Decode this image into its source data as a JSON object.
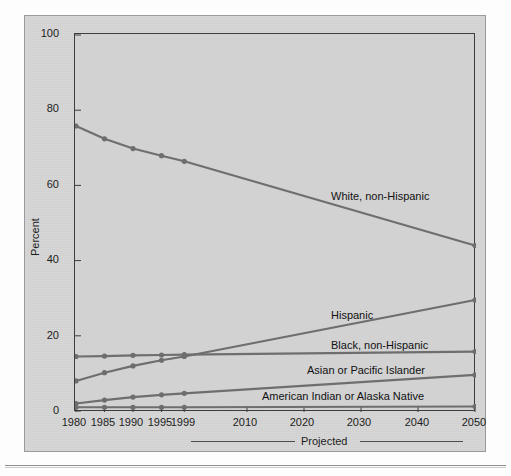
{
  "chart_data": {
    "type": "line",
    "title": "",
    "xlabel": "",
    "ylabel": "Percent",
    "ylim": [
      0,
      100
    ],
    "yticks": [
      0,
      20,
      40,
      60,
      80,
      100
    ],
    "ytick_labels": [
      "0",
      "20",
      "40",
      "60",
      "80",
      "100"
    ],
    "xticks": [
      1980,
      1985,
      1990,
      1995,
      1999,
      2010,
      2020,
      2030,
      2040,
      2050
    ],
    "xtick_labels": [
      "1980",
      "1985",
      "1990",
      "1995",
      "1999",
      "2010",
      "2020",
      "2030",
      "2040",
      "2050"
    ],
    "xlim": [
      1980,
      2050
    ],
    "grid": false,
    "legend_position": "inline-right",
    "annotations": [
      "Projected"
    ],
    "series": [
      {
        "name": "White, non-Hispanic",
        "label": "White, non-Hispanic",
        "x": [
          1980,
          1985,
          1990,
          1995,
          1999,
          2050
        ],
        "values": [
          75.8,
          72.4,
          69.8,
          67.9,
          66.4,
          44.0
        ],
        "color": "#6e6e6e"
      },
      {
        "name": "Hispanic",
        "label": "Hispanic",
        "x": [
          1980,
          1985,
          1990,
          1995,
          1999,
          2050
        ],
        "values": [
          8.0,
          10.2,
          12.0,
          13.5,
          14.5,
          29.5
        ],
        "color": "#6e6e6e"
      },
      {
        "name": "Black, non-Hispanic",
        "label": "Black, non-Hispanic",
        "x": [
          1980,
          1985,
          1990,
          1995,
          1999,
          2050
        ],
        "values": [
          14.5,
          14.6,
          14.8,
          14.9,
          15.0,
          15.8
        ],
        "color": "#6e6e6e"
      },
      {
        "name": "Asian or Pacific Islander",
        "label": "Asian or Pacific Islander",
        "x": [
          1980,
          1985,
          1990,
          1995,
          1999,
          2050
        ],
        "values": [
          2.0,
          2.9,
          3.7,
          4.3,
          4.7,
          9.6
        ],
        "color": "#6e6e6e"
      },
      {
        "name": "American Indian or Alaska Native",
        "label": "American Indian or Alaska Native",
        "x": [
          1980,
          1985,
          1990,
          1995,
          1999,
          2050
        ],
        "values": [
          1.0,
          1.0,
          1.0,
          1.0,
          1.0,
          1.2
        ],
        "color": "#6e6e6e"
      }
    ],
    "projected": {
      "label": "Projected",
      "from": 1999,
      "to": 2050
    },
    "colors": {
      "line": "#6e6e6e",
      "marker": "#6e6e6e",
      "axis": "#3d3d3d",
      "panel": "#d4d4d4",
      "plot_background": "#d2d2d2",
      "text": "#1c1c1c"
    }
  }
}
